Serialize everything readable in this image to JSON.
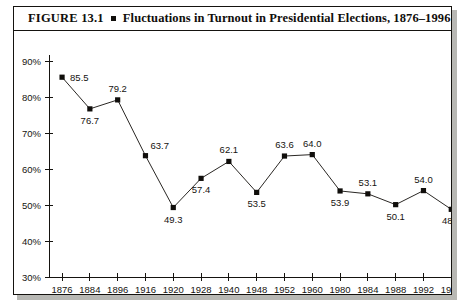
{
  "figure": {
    "number": "FIGURE 13.1",
    "bullet": "square-bullet",
    "caption": "Fluctuations in Turnout in Presidential Elections, 1876–1996"
  },
  "chart_data": {
    "type": "line",
    "title": "Fluctuations in Turnout in Presidential Elections, 1876–1996",
    "xlabel": "",
    "ylabel": "",
    "categories": [
      "1876",
      "1884",
      "1896",
      "1916",
      "1920",
      "1928",
      "1940",
      "1948",
      "1952",
      "1960",
      "1980",
      "1984",
      "1988",
      "1992",
      "1996"
    ],
    "values": [
      85.5,
      76.7,
      79.2,
      63.7,
      49.3,
      57.4,
      62.1,
      53.5,
      63.6,
      64.0,
      53.9,
      53.1,
      50.1,
      54.0,
      48.8
    ],
    "point_labels": [
      "85.5",
      "76.7",
      "79.2",
      "63.7",
      "49.3",
      "57.4",
      "62.1",
      "53.5",
      "63.6",
      "64.0",
      "53.9",
      "53.1",
      "50.1",
      "54.0",
      "48.8"
    ],
    "label_positions": [
      "right",
      "below",
      "above",
      "above-right",
      "below",
      "below",
      "above",
      "below",
      "above",
      "above",
      "below",
      "above",
      "below",
      "above",
      "below"
    ],
    "ylim": [
      30,
      90
    ],
    "ytick_values": [
      30,
      40,
      50,
      60,
      70,
      80,
      90
    ],
    "ytick_labels": [
      "30%",
      "40%",
      "50%",
      "60%",
      "70%",
      "80%",
      "90%"
    ],
    "grid": false,
    "legend": null,
    "marker": "square",
    "line_color": "#2a2724",
    "marker_color": "#100e0b"
  }
}
